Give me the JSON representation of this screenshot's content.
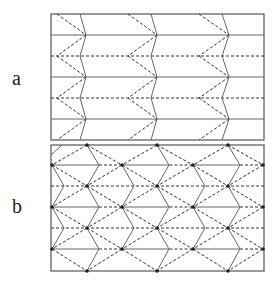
{
  "labels": {
    "a": "a",
    "b": "b"
  },
  "colors": {
    "frame": "#555555",
    "solid": "#666666",
    "dashed": "#333333",
    "node": "#222222"
  },
  "panel_a": {
    "frame": {
      "x": 51,
      "y": 14,
      "w": 213,
      "h": 126
    },
    "rows_y": [
      14,
      35,
      56,
      77,
      98,
      119,
      140
    ],
    "row_styles": [
      "frame",
      "solid",
      "dashed",
      "solid",
      "dashed",
      "solid",
      "frame"
    ],
    "units": [
      {
        "dash_x": 57,
        "solid_x": 80,
        "tip_x": 86
      },
      {
        "dash_x": 128,
        "solid_x": 151,
        "tip_x": 157
      },
      {
        "dash_x": 199,
        "solid_x": 222,
        "tip_x": 229
      }
    ]
  },
  "panel_b": {
    "frame": {
      "x": 51,
      "y": 145,
      "w": 213,
      "h": 126
    },
    "rows_y": [
      145,
      165,
      186,
      207,
      228,
      249,
      271
    ],
    "node_cols_even": [
      52,
      122,
      193,
      263
    ],
    "node_cols_odd": [
      87,
      157,
      228
    ],
    "tip_offset": 12
  }
}
